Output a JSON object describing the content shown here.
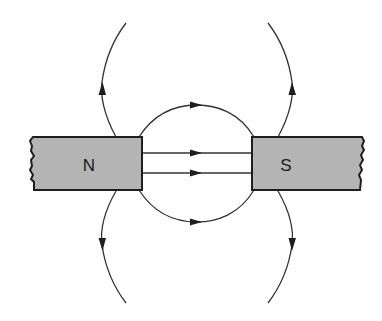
{
  "diagram": {
    "title": "",
    "type": "magnetic-field-lines-between-two-bar-magnets",
    "colors": {
      "magnet_fill": "#b4b4b4",
      "outline": "#1e1e1e",
      "field_line": "#333333",
      "background": "#ffffff"
    },
    "magnets": [
      {
        "id": "north",
        "label": "N",
        "side": "left"
      },
      {
        "id": "south",
        "label": "S",
        "side": "right"
      }
    ],
    "field_lines": [
      {
        "id": "gap-straight-upper",
        "direction": "N-to-S"
      },
      {
        "id": "gap-straight-lower",
        "direction": "N-to-S"
      },
      {
        "id": "gap-arc-top",
        "direction": "N-to-S"
      },
      {
        "id": "gap-arc-bottom",
        "direction": "N-to-S"
      },
      {
        "id": "outer-top-left",
        "direction": "away-from-N"
      },
      {
        "id": "outer-bottom-left",
        "direction": "away-from-N"
      },
      {
        "id": "outer-top-right",
        "direction": "away-from-S"
      },
      {
        "id": "outer-bottom-right",
        "direction": "away-from-S"
      }
    ]
  }
}
